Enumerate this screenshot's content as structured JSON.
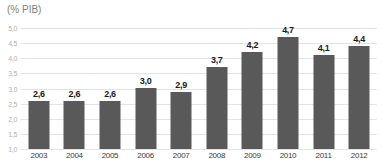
{
  "chart_data": {
    "type": "bar",
    "title": "(% PIB)",
    "categories": [
      "2003",
      "2004",
      "2005",
      "2006",
      "2007",
      "2008",
      "2009",
      "2010",
      "2011",
      "2012"
    ],
    "values": [
      2.6,
      2.6,
      2.6,
      3.0,
      2.9,
      3.7,
      4.2,
      4.7,
      4.1,
      4.4
    ],
    "value_labels": [
      "2,6",
      "2,6",
      "2,6",
      "3,0",
      "2,9",
      "3,7",
      "4,2",
      "4,7",
      "4,1",
      "4,4"
    ],
    "xlabel": "",
    "ylabel": "(% PIB)",
    "ylim": [
      1.0,
      5.0
    ],
    "ytick_labels": [
      "5,0",
      "4,5",
      "4,0",
      "3,5",
      "3,0",
      "2,5",
      "2,0",
      "1,5",
      "1,0"
    ],
    "grid": "horizontal",
    "legend": "none",
    "bar_color": "#595959",
    "gridline_color": "#e3e3e3",
    "background_color": "#ffffff"
  }
}
